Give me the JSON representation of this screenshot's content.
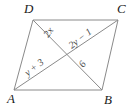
{
  "figure": {
    "shape_name": "parallelogram",
    "stroke_color": "#8a8a8a",
    "label_color": "#4a4a4a",
    "vertex_color": "#1a1a1a",
    "background": "#ffffff"
  },
  "vertices": [
    {
      "id": "A",
      "label": "A",
      "x": 14,
      "y": 90,
      "label_x": 7,
      "label_y": 103
    },
    {
      "id": "B",
      "label": "B",
      "x": 102,
      "y": 90,
      "label_x": 104,
      "label_y": 104
    },
    {
      "id": "C",
      "label": "C",
      "x": 118,
      "y": 20,
      "label_x": 117,
      "label_y": 13
    },
    {
      "id": "D",
      "label": "D",
      "x": 33,
      "y": 20,
      "label_x": 24,
      "label_y": 13
    }
  ],
  "edges": [
    {
      "id": "DC",
      "from": "D",
      "to": "C"
    },
    {
      "id": "CB",
      "from": "C",
      "to": "B"
    },
    {
      "id": "BA",
      "from": "B",
      "to": "A"
    },
    {
      "id": "AD",
      "from": "A",
      "to": "D"
    }
  ],
  "diagonals": [
    {
      "id": "DB",
      "from": "D",
      "to": "B"
    },
    {
      "id": "AC",
      "from": "A",
      "to": "C"
    }
  ],
  "intersection": {
    "id": "E",
    "x": 66,
    "y": 55
  },
  "segment_labels": [
    {
      "id": "2x",
      "text": "2x",
      "x": 51,
      "y": 34,
      "rotation": -55,
      "segment": "DE"
    },
    {
      "id": "2y-1",
      "text": "2y − 1",
      "x": 82,
      "y": 41,
      "rotation": -38,
      "segment": "EC"
    },
    {
      "id": "y+3",
      "text": "y + 3",
      "x": 36,
      "y": 70,
      "rotation": -38,
      "segment": "AE"
    },
    {
      "id": "6",
      "text": "6",
      "x": 85,
      "y": 66,
      "rotation": -55,
      "segment": "EB"
    }
  ]
}
